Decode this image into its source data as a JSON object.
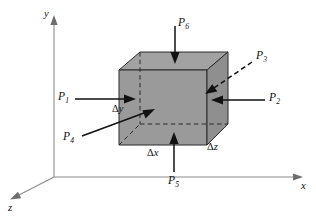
{
  "figure": {
    "type": "3d-cube-force-diagram",
    "colors": {
      "face_fill": "#9a9a9a",
      "face_fill_top": "#a2a2a2",
      "face_fill_right": "#8f8f8f",
      "edge": "#2b2b2b",
      "axis": "#8a8a8a",
      "arrow": "#111111",
      "background": "#ffffff"
    }
  },
  "axes": [
    {
      "name": "y-axis",
      "label": "y",
      "direction": "up"
    },
    {
      "name": "x-axis",
      "label": "x",
      "direction": "right"
    },
    {
      "name": "z-axis",
      "label": "z",
      "direction": "down-left"
    }
  ],
  "forces": [
    {
      "name": "P1",
      "label": "P",
      "subscript": "1",
      "direction": "right",
      "style": "solid",
      "face": "left"
    },
    {
      "name": "P2",
      "label": "P",
      "subscript": "2",
      "direction": "left",
      "style": "solid",
      "face": "right"
    },
    {
      "name": "P3",
      "label": "P",
      "subscript": "3",
      "direction": "down-left",
      "style": "dashed",
      "face": "back"
    },
    {
      "name": "P4",
      "label": "P",
      "subscript": "4",
      "direction": "up-right",
      "style": "solid",
      "face": "front"
    },
    {
      "name": "P5",
      "label": "P",
      "subscript": "5",
      "direction": "up",
      "style": "solid",
      "face": "bottom"
    },
    {
      "name": "P6",
      "label": "P",
      "subscript": "6",
      "direction": "down",
      "style": "solid",
      "face": "top"
    }
  ],
  "dimensions": [
    {
      "name": "delta-y",
      "symbol": "Δ",
      "variable": "y",
      "axis": "y"
    },
    {
      "name": "delta-x",
      "symbol": "Δ",
      "variable": "x",
      "axis": "x"
    },
    {
      "name": "delta-z",
      "symbol": "Δ",
      "variable": "z",
      "axis": "z"
    }
  ]
}
